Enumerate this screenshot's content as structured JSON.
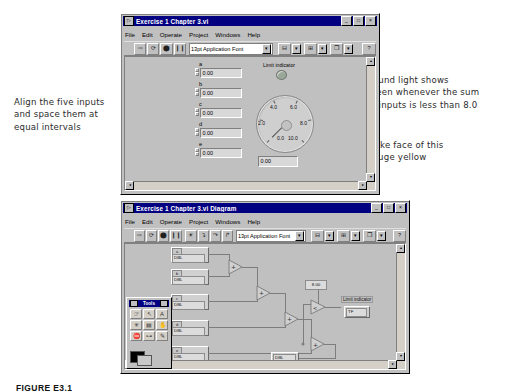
{
  "annotations": {
    "left": "Align the five inputs\nand space them at\nequal intervals",
    "right_top": "Round light shows\ngreen whenever the sum\nof inputs is less than 8.0",
    "right_bottom": "Make face of this\ngauge yellow"
  },
  "caption": "FIGURE E3.1",
  "front_panel": {
    "title": "Exercise 1 Chapter 3.vi",
    "window_icon": "vi-icon",
    "buttons": {
      "minimize": "_",
      "maximize": "□",
      "close": "×"
    },
    "menus": [
      "File",
      "Edit",
      "Operate",
      "Project",
      "Windows",
      "Help"
    ],
    "toolbar": {
      "run": "run-arrow-icon",
      "run_continuous": "run-continuous-icon",
      "abort": "abort-icon",
      "pause": "pause-icon",
      "font": "13pt Application Font",
      "align": "align-objects-icon",
      "distribute": "distribute-objects-icon",
      "reorder": "reorder-icon",
      "context_help": "context-help-icon"
    },
    "controls": [
      {
        "label": "a",
        "value": "0.00"
      },
      {
        "label": "b",
        "value": "0.00"
      },
      {
        "label": "c",
        "value": "0.00"
      },
      {
        "label": "d",
        "value": "0.00"
      },
      {
        "label": "e",
        "value": "0.00"
      }
    ],
    "led": {
      "label": "Limit indicator",
      "state": "off"
    },
    "gauge": {
      "label": "",
      "digital_value": "0.00",
      "ticks": [
        "0.0",
        "2.0",
        "4.0",
        "6.0",
        "8.0",
        "10.0"
      ],
      "min": 0.0,
      "max": 10.0,
      "needle_value": 0.0
    }
  },
  "block_diagram": {
    "title": "Exercise 1 Chapter 3.vi Diagram",
    "buttons": {
      "minimize": "_",
      "maximize": "□",
      "close": "×"
    },
    "menus": [
      "File",
      "Edit",
      "Operate",
      "Project",
      "Windows",
      "Help"
    ],
    "toolbar": {
      "run": "run-arrow-icon",
      "run_continuous": "run-continuous-icon",
      "abort": "abort-icon",
      "pause": "pause-icon",
      "highlight": "highlight-execution-icon",
      "step_into": "step-into-icon",
      "step_over": "step-over-icon",
      "step_out": "step-out-icon",
      "font": "13pt Application Font",
      "align": "align-objects-icon",
      "distribute": "distribute-objects-icon",
      "reorder": "reorder-icon",
      "context_help": "context-help-icon"
    },
    "terminals": [
      {
        "label": "a",
        "value": "DBL"
      },
      {
        "label": "b",
        "value": "DBL"
      },
      {
        "label": "c",
        "value": "DBL"
      },
      {
        "label": "d",
        "value": "DBL"
      },
      {
        "label": "e",
        "value": "DBL"
      }
    ],
    "add_nodes": 4,
    "constant": "8.00",
    "compare_node": "less-than-icon",
    "indicators": [
      {
        "label": "Limit indicator",
        "value": "TF"
      },
      {
        "label": "",
        "value": "DBL"
      }
    ]
  },
  "tools_palette": {
    "title": "Tools",
    "pin": "pin-icon",
    "close": "close-icon",
    "tools": [
      "operate-value-icon",
      "position-size-icon",
      "edit-text-icon",
      "connect-wire-icon",
      "object-shortcut-menu-icon",
      "scroll-window-icon",
      "set-breakpoint-icon",
      "probe-data-icon",
      "get-color-icon"
    ],
    "colors": [
      "#000000",
      "#c8c8c8"
    ]
  }
}
